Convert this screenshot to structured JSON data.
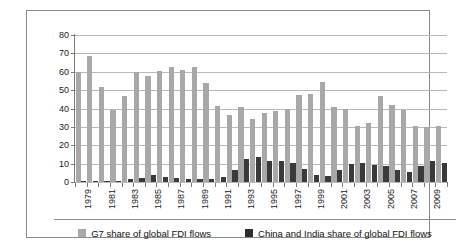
{
  "chart_data": {
    "type": "bar",
    "title": "",
    "xlabel": "",
    "ylabel": "",
    "ylim": [
      0,
      80
    ],
    "yticks": [
      0,
      10,
      20,
      30,
      40,
      50,
      60,
      70,
      80
    ],
    "grid": true,
    "legend_position": "bottom",
    "categories": [
      "1979",
      "1980",
      "1981",
      "1982",
      "1983",
      "1984",
      "1985",
      "1986",
      "1987",
      "1988",
      "1989",
      "1990",
      "1991",
      "1992",
      "1993",
      "1994",
      "1995",
      "1996",
      "1997",
      "1998",
      "1999",
      "2000",
      "2001",
      "2002",
      "2003",
      "2004",
      "2005",
      "2006",
      "2007",
      "2008",
      "2009",
      "2010"
    ],
    "tick_labels": [
      "1979",
      "",
      "1981",
      "",
      "1983",
      "",
      "1985",
      "",
      "1987",
      "",
      "1989",
      "",
      "1991",
      "",
      "1993",
      "",
      "1995",
      "",
      "1997",
      "",
      "1999",
      "",
      "2001",
      "",
      "2003",
      "",
      "2005",
      "",
      "2007",
      "",
      "2009",
      ""
    ],
    "series": [
      {
        "name": "G7 share of global FDI flows",
        "color": "#a8a8a8",
        "values": [
          60.0,
          68.7,
          51.6,
          39.0,
          46.7,
          59.9,
          57.7,
          60.5,
          62.6,
          60.9,
          62.6,
          54.0,
          41.3,
          36.7,
          40.7,
          34.2,
          37.4,
          38.7,
          39.9,
          47.2,
          47.7,
          54.2,
          41.0,
          40.0,
          30.6,
          32.3,
          46.6,
          41.7,
          39.0,
          30.6,
          30.0,
          30.7
        ]
      },
      {
        "name": "China and India share of global FDI flows",
        "color": "#2e2e2e",
        "values": [
          0.3,
          0.4,
          0.4,
          0.8,
          1.7,
          2.2,
          3.9,
          2.9,
          2.0,
          1.9,
          1.8,
          1.6,
          2.7,
          6.8,
          12.5,
          13.6,
          11.4,
          11.5,
          10.2,
          7.2,
          3.9,
          3.2,
          6.3,
          9.7,
          10.1,
          9.0,
          8.5,
          6.4,
          5.5,
          8.7,
          11.2,
          10.5
        ]
      }
    ]
  },
  "legend": {
    "items": [
      {
        "label": "G7 share of global FDI flows",
        "swatch": "g7"
      },
      {
        "label": "China and India share of global FDI flows",
        "swatch": "ci"
      }
    ]
  }
}
